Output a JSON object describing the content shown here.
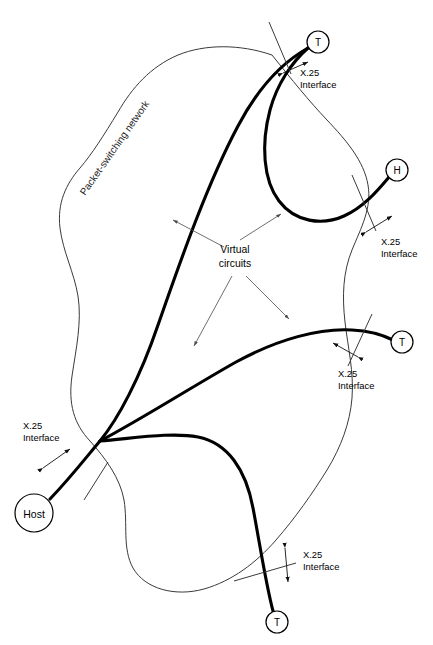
{
  "diagram": {
    "network_label": "Packet-switching network",
    "virtual_circuits_label_line1": "Virtual",
    "virtual_circuits_label_line2": "circuits",
    "interface_label_line1": "X.25",
    "interface_label_line2": "Interface",
    "colors": {
      "background": "#ffffff",
      "cloud_stroke": "#3a3a3a",
      "circuit_stroke": "#000000",
      "text": "#000000",
      "leader_stroke": "#4a4a4a"
    },
    "nodes": [
      {
        "id": "t-top",
        "label": "T",
        "kind": "terminal",
        "x": 318,
        "y": 42,
        "r": 11
      },
      {
        "id": "h-right",
        "label": "H",
        "kind": "host",
        "x": 397,
        "y": 170,
        "r": 11
      },
      {
        "id": "t-middle",
        "label": "T",
        "kind": "terminal",
        "x": 402,
        "y": 342,
        "r": 11
      },
      {
        "id": "t-bottom",
        "label": "T",
        "kind": "terminal",
        "x": 277,
        "y": 622,
        "r": 11
      },
      {
        "id": "host-left",
        "label": "Host",
        "kind": "host",
        "x": 34,
        "y": 513,
        "r": 19
      }
    ],
    "interface_markers": [
      {
        "id": "iface-top",
        "text_x": 300,
        "text_y": 72,
        "tick_x1": 269,
        "tick_y1": 22,
        "tick_x2": 291,
        "tick_y2": 74,
        "arrow_x1": 283,
        "arrow_y1": 73,
        "arrow_x2": 308,
        "arrow_y2": 62
      },
      {
        "id": "iface-h",
        "text_x": 380,
        "text_y": 240,
        "tick_x1": 352,
        "tick_y1": 175,
        "tick_x2": 376,
        "tick_y2": 231,
        "arrow_x1": 366,
        "arrow_y1": 230,
        "arrow_x2": 392,
        "arrow_y2": 215
      },
      {
        "id": "iface-middle",
        "text_x": 340,
        "text_y": 367,
        "tick_x1": 372,
        "tick_y1": 315,
        "tick_x2": 347,
        "tick_y2": 367,
        "arrow_x1": 358,
        "arrow_y1": 355,
        "arrow_x2": 333,
        "arrow_y2": 343
      },
      {
        "id": "iface-host",
        "text_x": 22,
        "text_y": 425,
        "tick_x1": 107,
        "tick_y1": 465,
        "tick_x2": 83,
        "tick_y2": 498,
        "arrow_x1": 43,
        "arrow_y1": 468,
        "arrow_x2": 69,
        "arrow_y2": 450
      },
      {
        "id": "iface-bottom",
        "text_x": 303,
        "text_y": 556,
        "tick_x1": 236,
        "tick_y1": 580,
        "tick_x2": 298,
        "tick_y2": 564,
        "arrow_x1": 285,
        "arrow_y1": 548,
        "arrow_x2": 288,
        "arrow_y2": 581
      }
    ],
    "leader_lines": [
      {
        "id": "leader-to-left-circuit",
        "x1": 224,
        "y1": 247,
        "x2": 172,
        "y2": 219
      },
      {
        "id": "leader-to-top-circuit",
        "x1": 238,
        "y1": 240,
        "x2": 280,
        "y2": 214
      },
      {
        "id": "leader-to-bottom-circuit",
        "x1": 233,
        "y1": 275,
        "x2": 193,
        "y2": 347
      },
      {
        "id": "leader-to-right-circuit",
        "x1": 245,
        "y1": 275,
        "x2": 290,
        "y2": 320
      }
    ]
  }
}
